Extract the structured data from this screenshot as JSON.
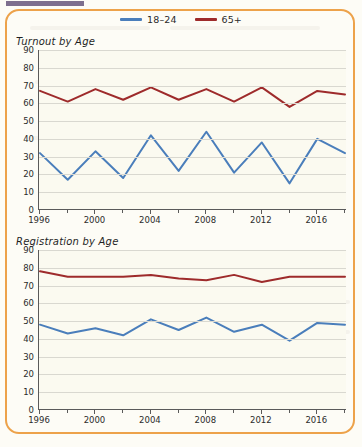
{
  "figure": {
    "border_color": "#eda24a",
    "background_color": "#fbfaf0"
  },
  "legend": {
    "entries": [
      {
        "label": "18–24",
        "color": "#4a7ebb"
      },
      {
        "label": "65+",
        "color": "#9e2b2b"
      }
    ]
  },
  "chart_data": [
    {
      "type": "line",
      "title": "Turnout by Age",
      "xlabel": "",
      "ylabel": "",
      "ylim": [
        0,
        90
      ],
      "ytick_step": 10,
      "yticks": [
        0,
        10,
        20,
        30,
        40,
        50,
        60,
        70,
        80,
        90
      ],
      "grid": true,
      "legend_position": "top-center",
      "x": [
        1996,
        1998,
        2000,
        2002,
        2004,
        2006,
        2008,
        2010,
        2012,
        2014,
        2016,
        2018
      ],
      "xtick_labels": [
        "1996",
        "2000",
        "2004",
        "2008",
        "2012",
        "2016"
      ],
      "xticks": [
        1996,
        2000,
        2004,
        2008,
        2012,
        2016
      ],
      "series": [
        {
          "name": "18–24",
          "color": "#4a7ebb",
          "values": [
            32,
            17,
            33,
            18,
            42,
            22,
            44,
            21,
            38,
            15,
            40,
            32
          ]
        },
        {
          "name": "65+",
          "color": "#9e2b2b",
          "values": [
            67,
            61,
            68,
            62,
            69,
            62,
            68,
            61,
            69,
            58,
            67,
            65
          ]
        }
      ]
    },
    {
      "type": "line",
      "title": "Registration by Age",
      "xlabel": "",
      "ylabel": "",
      "ylim": [
        0,
        90
      ],
      "ytick_step": 10,
      "yticks": [
        0,
        10,
        20,
        30,
        40,
        50,
        60,
        70,
        80,
        90
      ],
      "grid": true,
      "legend_position": "top-center",
      "x": [
        1996,
        1998,
        2000,
        2002,
        2004,
        2006,
        2008,
        2010,
        2012,
        2014,
        2016,
        2018
      ],
      "xtick_labels": [
        "1996",
        "2000",
        "2004",
        "2008",
        "2012",
        "2016"
      ],
      "xticks": [
        1996,
        2000,
        2004,
        2008,
        2012,
        2016
      ],
      "series": [
        {
          "name": "18–24",
          "color": "#4a7ebb",
          "values": [
            48,
            43,
            46,
            42,
            51,
            45,
            52,
            44,
            48,
            39,
            49,
            48
          ]
        },
        {
          "name": "65+",
          "color": "#9e2b2b",
          "values": [
            78,
            75,
            75,
            75,
            76,
            74,
            73,
            76,
            72,
            75,
            75,
            75
          ]
        }
      ]
    }
  ]
}
